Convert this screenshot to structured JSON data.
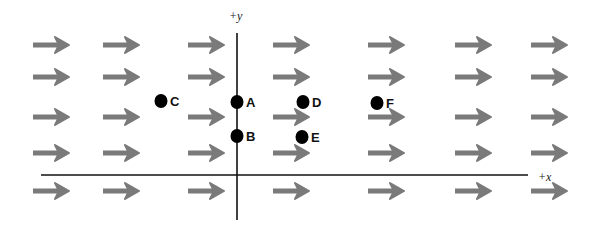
{
  "diagram": {
    "title": "",
    "field": {
      "description": "Uniform field pointing in +x direction",
      "arrow_color": "#7a7a7a",
      "columns_x": [
        33,
        103,
        188,
        273,
        368,
        455,
        531
      ],
      "rows_y": [
        45,
        77,
        117,
        153,
        191
      ],
      "arrow_length": 36
    },
    "axes": {
      "x_label": "+x",
      "y_label": "+y",
      "origin": {
        "x": 237,
        "y": 175
      },
      "x_axis": {
        "x1": 41,
        "x2": 528
      },
      "y_axis": {
        "y1": 33,
        "y2": 220
      }
    },
    "points": [
      {
        "label": "A",
        "x": 237,
        "y": 102
      },
      {
        "label": "B",
        "x": 237,
        "y": 136
      },
      {
        "label": "C",
        "x": 161,
        "y": 101
      },
      {
        "label": "D",
        "x": 303,
        "y": 102
      },
      {
        "label": "E",
        "x": 302,
        "y": 137
      },
      {
        "label": "F",
        "x": 377,
        "y": 103
      }
    ]
  }
}
